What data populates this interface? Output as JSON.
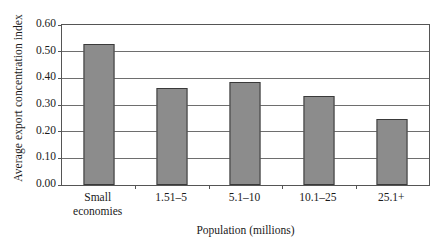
{
  "chart_data": {
    "type": "bar",
    "title": "",
    "xlabel": "Population (millions)",
    "ylabel": "Average export concentration index",
    "categories": [
      "Small economies",
      "1.51–5",
      "5.1–10",
      "10.1–25",
      "25.1+"
    ],
    "category_lines": [
      [
        "Small",
        "economies"
      ],
      [
        "1.51–5"
      ],
      [
        "5.1–10"
      ],
      [
        "10.1–25"
      ],
      [
        "25.1+"
      ]
    ],
    "values": [
      0.528,
      0.362,
      0.388,
      0.333,
      0.247
    ],
    "ylim": [
      0.0,
      0.6
    ],
    "ytick_values": [
      0.0,
      0.1,
      0.2,
      0.3,
      0.4,
      0.5,
      0.6
    ],
    "ytick_labels": [
      "0.00",
      "0.10",
      "0.20",
      "0.30",
      "0.40",
      "0.50",
      "0.60"
    ],
    "grid": true,
    "grid_axis": "y",
    "legend": false,
    "legend_position": "none",
    "bar_color": "#8c8c8c",
    "bar_border_color": "#3a3a3a",
    "axis_color": "#555555",
    "grid_color": "#6e6e6e",
    "background": "#ffffff"
  }
}
